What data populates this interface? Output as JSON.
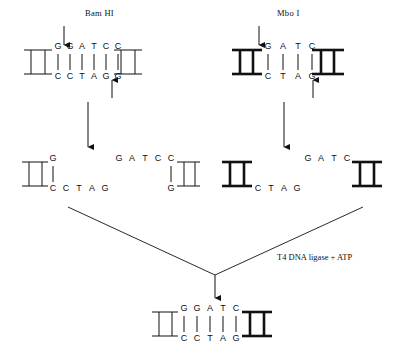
{
  "figure": {
    "title_top_left": "Bam HI",
    "title_top_right": "Mbo I",
    "ligase_label": "T4 DNA ligase + ATP",
    "ink_color": "#111111",
    "background": "#ffffff"
  },
  "panels": {
    "bamhi": {
      "enzyme": "Bam HI",
      "top_strand": [
        "G",
        "G",
        "A",
        "T",
        "C",
        "C"
      ],
      "bottom_strand": [
        "C",
        "C",
        "T",
        "A",
        "G",
        "G"
      ],
      "end_style": "thin",
      "cut_top_after_index": 1,
      "cut_bottom_after_index": 5
    },
    "mboi": {
      "enzyme": "Mbo I",
      "top_strand": [
        "G",
        "A",
        "T",
        "C"
      ],
      "bottom_strand": [
        "C",
        "T",
        "A",
        "G"
      ],
      "end_style": "bold",
      "cut_top_after_index": 0,
      "cut_bottom_after_index": 4
    }
  },
  "products": {
    "bamhi_left": {
      "top_strand": [
        "G"
      ],
      "bottom_strand": [
        "C",
        "C",
        "T",
        "A",
        "G"
      ],
      "end_style": "thin",
      "overhang": "5-prime-GATC"
    },
    "bamhi_right": {
      "top_strand": [
        "G",
        "A",
        "T",
        "C",
        "C"
      ],
      "bottom_strand": [
        "G"
      ],
      "end_style": "thin",
      "overhang": "5-prime-GATC"
    },
    "mboi_left": {
      "top_strand": [],
      "bottom_strand": [
        "C",
        "T",
        "A",
        "G"
      ],
      "end_style": "bold",
      "overhang": "5-prime-GATC"
    },
    "mboi_right": {
      "top_strand": [
        "G",
        "A",
        "T",
        "C"
      ],
      "bottom_strand": [],
      "end_style": "bold",
      "overhang": "5-prime-GATC"
    }
  },
  "ligated": {
    "top_strand": [
      "G",
      "G",
      "A",
      "T",
      "C"
    ],
    "bottom_strand": [
      "C",
      "C",
      "T",
      "A",
      "G"
    ],
    "left_end_style": "thin",
    "right_end_style": "bold"
  }
}
